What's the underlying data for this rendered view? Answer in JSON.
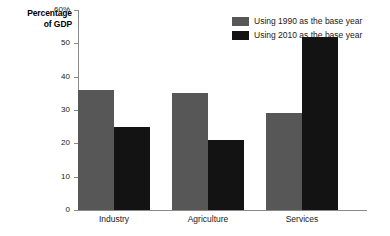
{
  "chart_data": {
    "type": "bar",
    "title": "",
    "ylabel": "Percentage of GDP",
    "ylabel_lines": [
      "Percentage",
      "of GDP"
    ],
    "xlabel": "",
    "categories": [
      "Industry",
      "Agriculture",
      "Services"
    ],
    "series": [
      {
        "name": "Using 1990 as the base year",
        "color": "#575757",
        "values": [
          36,
          35,
          29
        ]
      },
      {
        "name": "Using 2010 as the base year",
        "color": "#131313",
        "values": [
          25,
          21,
          52
        ]
      }
    ],
    "ylim": [
      0,
      60
    ],
    "ytick_values": [
      0,
      10,
      20,
      30,
      40,
      50,
      60
    ],
    "ytick_labels": [
      "0",
      "10",
      "20",
      "30",
      "40",
      "50",
      "60%"
    ],
    "grid": false,
    "legend_position": "top-right",
    "axis_color": "#8a8a8a",
    "background_color": "#ffffff"
  },
  "legend": {
    "items": [
      {
        "label": "Using 1990 as the base year",
        "color": "#575757"
      },
      {
        "label": "Using 2010 as the base year",
        "color": "#131313"
      }
    ]
  }
}
